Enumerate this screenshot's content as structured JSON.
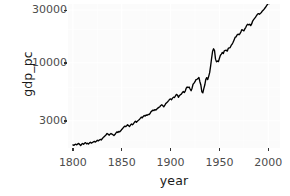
{
  "chart_data": {
    "type": "line",
    "title": "",
    "xlabel": "year",
    "ylabel": "gdp_pc",
    "yscale": "log",
    "xlim": [
      1795,
      2012
    ],
    "ylim": [
      1700,
      34000
    ],
    "grid": true,
    "legend": false,
    "xticks": [
      1800,
      1850,
      1900,
      1950,
      2000
    ],
    "xtick_labels": [
      "1800",
      "1850",
      "1900",
      "1950",
      "2000"
    ],
    "yticks": [
      3000,
      10000,
      30000
    ],
    "ytick_labels": [
      "3000",
      "10000",
      "30000"
    ],
    "line_color": "#000000",
    "panel_color": "#fbfbfb",
    "grid_color": "#ffffff",
    "series": [
      {
        "name": "gdp_pc",
        "x": [
          1800,
          1801,
          1802,
          1803,
          1804,
          1805,
          1806,
          1807,
          1808,
          1809,
          1810,
          1811,
          1812,
          1813,
          1814,
          1815,
          1816,
          1817,
          1818,
          1819,
          1820,
          1821,
          1822,
          1823,
          1824,
          1825,
          1826,
          1827,
          1828,
          1829,
          1830,
          1831,
          1832,
          1833,
          1834,
          1835,
          1836,
          1837,
          1838,
          1839,
          1840,
          1841,
          1842,
          1843,
          1844,
          1845,
          1846,
          1847,
          1848,
          1849,
          1850,
          1851,
          1852,
          1853,
          1854,
          1855,
          1856,
          1857,
          1858,
          1859,
          1860,
          1861,
          1862,
          1863,
          1864,
          1865,
          1866,
          1867,
          1868,
          1869,
          1870,
          1871,
          1872,
          1873,
          1874,
          1875,
          1876,
          1877,
          1878,
          1879,
          1880,
          1881,
          1882,
          1883,
          1884,
          1885,
          1886,
          1887,
          1888,
          1889,
          1890,
          1891,
          1892,
          1893,
          1894,
          1895,
          1896,
          1897,
          1898,
          1899,
          1900,
          1901,
          1902,
          1903,
          1904,
          1905,
          1906,
          1907,
          1908,
          1909,
          1910,
          1911,
          1912,
          1913,
          1914,
          1915,
          1916,
          1917,
          1918,
          1919,
          1920,
          1921,
          1922,
          1923,
          1924,
          1925,
          1926,
          1927,
          1928,
          1929,
          1930,
          1931,
          1932,
          1933,
          1934,
          1935,
          1936,
          1937,
          1938,
          1939,
          1940,
          1941,
          1942,
          1943,
          1944,
          1945,
          1946,
          1947,
          1948,
          1949,
          1950,
          1951,
          1952,
          1953,
          1954,
          1955,
          1956,
          1957,
          1958,
          1959,
          1960,
          1961,
          1962,
          1963,
          1964,
          1965,
          1966,
          1967,
          1968,
          1969,
          1970,
          1971,
          1972,
          1973,
          1974,
          1975,
          1976,
          1977,
          1978,
          1979,
          1980,
          1981,
          1982,
          1983,
          1984,
          1985,
          1986,
          1987,
          1988,
          1989,
          1990,
          1991,
          1992,
          1993,
          1994,
          1995,
          1996,
          1997,
          1998,
          1999,
          2000,
          2001,
          2002,
          2003,
          2004,
          2005,
          2006,
          2007,
          2008,
          2009,
          2010
        ],
        "values": [
          1810,
          1795,
          1825,
          1840,
          1815,
          1850,
          1870,
          1830,
          1790,
          1845,
          1865,
          1835,
          1880,
          1900,
          1855,
          1875,
          1845,
          1890,
          1915,
          1880,
          1905,
          1930,
          1950,
          1920,
          1960,
          1995,
          1970,
          2005,
          2030,
          2010,
          2060,
          2110,
          2150,
          2190,
          2240,
          2300,
          2270,
          2220,
          2260,
          2300,
          2270,
          2240,
          2200,
          2250,
          2320,
          2380,
          2350,
          2400,
          2380,
          2430,
          2500,
          2560,
          2620,
          2680,
          2650,
          2700,
          2760,
          2700,
          2660,
          2740,
          2800,
          2760,
          2820,
          2900,
          2960,
          2900,
          2960,
          3020,
          3080,
          3150,
          3230,
          3180,
          3280,
          3340,
          3300,
          3380,
          3350,
          3420,
          3400,
          3480,
          3620,
          3680,
          3740,
          3700,
          3780,
          3740,
          3820,
          3900,
          3960,
          4010,
          4120,
          4180,
          4100,
          4000,
          4120,
          4280,
          4350,
          4450,
          4560,
          4680,
          4720,
          4640,
          4800,
          4900,
          4860,
          5020,
          5180,
          5120,
          4880,
          5050,
          5150,
          5220,
          5380,
          5500,
          5380,
          5560,
          5900,
          6050,
          5980,
          6050,
          5800,
          5600,
          5900,
          6400,
          6550,
          6750,
          7050,
          7100,
          7200,
          7380,
          6750,
          6300,
          5480,
          5350,
          5850,
          6300,
          7050,
          7350,
          7050,
          7550,
          8150,
          9400,
          11000,
          12700,
          13400,
          12900,
          10800,
          10200,
          10400,
          10250,
          11000,
          11700,
          12000,
          12400,
          12150,
          12850,
          12950,
          13000,
          12750,
          13500,
          13650,
          13750,
          14350,
          14750,
          15350,
          16100,
          16950,
          17150,
          17800,
          18150,
          17950,
          18300,
          19050,
          19950,
          19700,
          19450,
          20250,
          20950,
          21850,
          22300,
          22000,
          22350,
          21700,
          22450,
          23850,
          24550,
          25200,
          25850,
          26750,
          27600,
          27850,
          27500,
          28050,
          28500,
          29400,
          29950,
          30750,
          31600,
          32600,
          33600,
          34550,
          34300,
          34750,
          35450,
          36500,
          37500,
          38350,
          38900,
          38450,
          36900,
          37700
        ]
      }
    ]
  },
  "axes": {
    "y_title": "gdp_pc",
    "x_title": "year"
  }
}
